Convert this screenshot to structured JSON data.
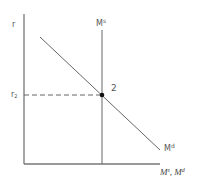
{
  "diagram": {
    "y_axis_label": "r",
    "x_axis_label_main": "M",
    "x_axis_label_sup1": "s",
    "x_axis_label_sep": ", ",
    "x_axis_label_main2": "M",
    "x_axis_label_sup2": "d",
    "supply_label_main": "M",
    "supply_label_sup": "s",
    "demand_label_main": "M",
    "demand_label_sup": "d",
    "equilibrium_label": "2",
    "rate_label_main": "r",
    "rate_label_sub": "2",
    "colors": {
      "axis": "#777777",
      "line": "#666666",
      "dashed": "#666666",
      "point": "#111111"
    }
  }
}
